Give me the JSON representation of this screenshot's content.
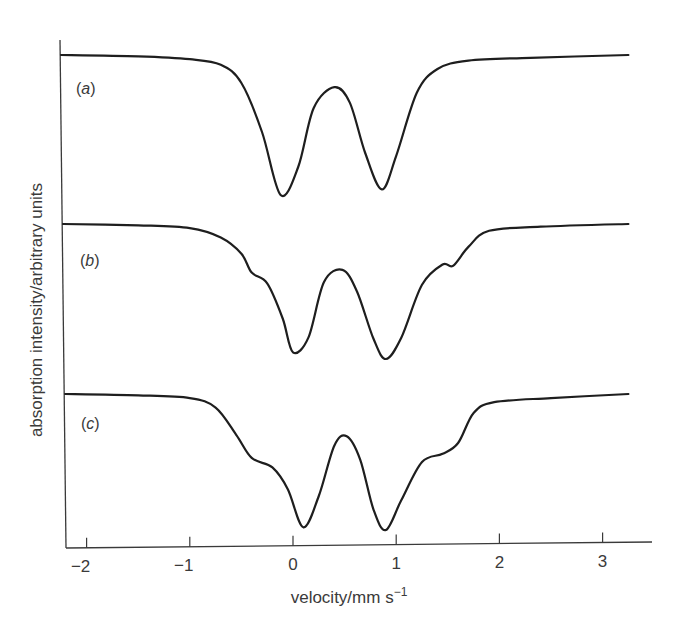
{
  "chart_data": {
    "type": "line",
    "title": "",
    "xlabel": "velocity/mm s",
    "xlabel_superscript": "−1",
    "ylabel": "absorption intensity/arbitrary units",
    "xlim": [
      -2.3,
      3.5
    ],
    "xticks": [
      -2,
      -1,
      0,
      1,
      2,
      3
    ],
    "xtick_labels": [
      "−2",
      "−1",
      "0",
      "1",
      "2",
      "3"
    ],
    "yticks": [],
    "grid": false,
    "legend": "none (curves labelled inline)",
    "series": [
      {
        "name": "(a)",
        "label_letter": "a",
        "description": "symmetric quadrupole doublet",
        "minima_velocity": [
          -0.12,
          0.86
        ],
        "points": [
          [
            -2.25,
            1.0
          ],
          [
            -1.5,
            0.99
          ],
          [
            -1.0,
            0.97
          ],
          [
            -0.7,
            0.93
          ],
          [
            -0.5,
            0.8
          ],
          [
            -0.3,
            0.45
          ],
          [
            -0.12,
            0.0
          ],
          [
            0.05,
            0.2
          ],
          [
            0.2,
            0.62
          ],
          [
            0.4,
            0.77
          ],
          [
            0.55,
            0.66
          ],
          [
            0.7,
            0.3
          ],
          [
            0.86,
            0.04
          ],
          [
            1.0,
            0.28
          ],
          [
            1.2,
            0.73
          ],
          [
            1.4,
            0.9
          ],
          [
            1.7,
            0.96
          ],
          [
            2.3,
            0.98
          ],
          [
            3.25,
            1.0
          ]
        ]
      },
      {
        "name": "(b)",
        "label_letter": "b",
        "description": "doublet with weak satellite shoulders",
        "minima_velocity": [
          0.0,
          0.9
        ],
        "points": [
          [
            -2.25,
            1.0
          ],
          [
            -1.5,
            0.99
          ],
          [
            -1.0,
            0.97
          ],
          [
            -0.7,
            0.9
          ],
          [
            -0.5,
            0.78
          ],
          [
            -0.4,
            0.64
          ],
          [
            -0.25,
            0.56
          ],
          [
            -0.1,
            0.3
          ],
          [
            0.0,
            0.05
          ],
          [
            0.15,
            0.16
          ],
          [
            0.3,
            0.57
          ],
          [
            0.48,
            0.66
          ],
          [
            0.62,
            0.5
          ],
          [
            0.78,
            0.15
          ],
          [
            0.9,
            0.0
          ],
          [
            1.05,
            0.16
          ],
          [
            1.25,
            0.55
          ],
          [
            1.45,
            0.7
          ],
          [
            1.55,
            0.69
          ],
          [
            1.7,
            0.83
          ],
          [
            1.9,
            0.95
          ],
          [
            2.4,
            0.98
          ],
          [
            3.25,
            1.0
          ]
        ]
      },
      {
        "name": "(c)",
        "label_letter": "c",
        "description": "doublet with stronger satellite shoulders",
        "minima_velocity": [
          0.1,
          0.9
        ],
        "points": [
          [
            -2.25,
            1.0
          ],
          [
            -1.5,
            0.99
          ],
          [
            -1.0,
            0.97
          ],
          [
            -0.75,
            0.9
          ],
          [
            -0.55,
            0.7
          ],
          [
            -0.4,
            0.53
          ],
          [
            -0.2,
            0.46
          ],
          [
            -0.05,
            0.3
          ],
          [
            0.1,
            0.02
          ],
          [
            0.25,
            0.25
          ],
          [
            0.4,
            0.62
          ],
          [
            0.52,
            0.69
          ],
          [
            0.65,
            0.52
          ],
          [
            0.78,
            0.15
          ],
          [
            0.9,
            0.0
          ],
          [
            1.05,
            0.22
          ],
          [
            1.25,
            0.5
          ],
          [
            1.45,
            0.56
          ],
          [
            1.6,
            0.64
          ],
          [
            1.75,
            0.86
          ],
          [
            1.95,
            0.94
          ],
          [
            2.5,
            0.97
          ],
          [
            3.25,
            1.0
          ]
        ]
      }
    ]
  },
  "labels": {
    "a": "a",
    "b": "b",
    "c": "c"
  }
}
